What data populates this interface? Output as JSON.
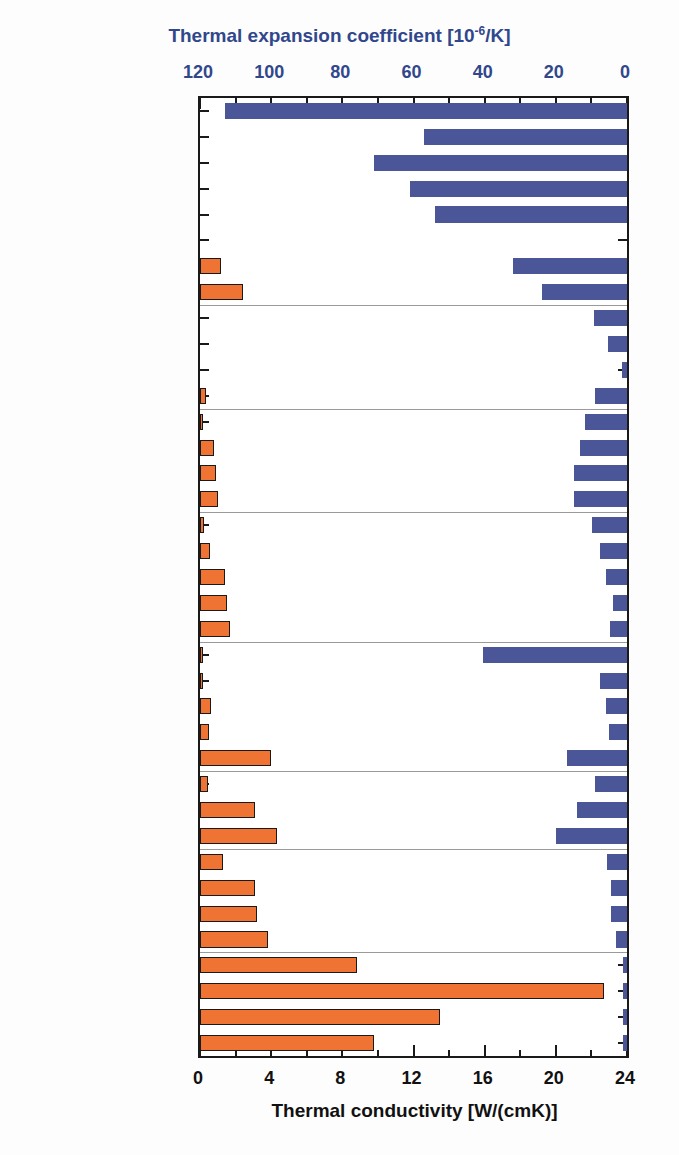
{
  "chart_data": {
    "type": "bar",
    "orientation": "horizontal",
    "title": "",
    "top_axis": {
      "label": "Thermal expansion coefficient [10-6/K]",
      "label_main": "Thermal expansion coefficient [10",
      "label_sup": "-6",
      "label_tail": "/K]",
      "ticks": [
        120,
        100,
        80,
        60,
        40,
        20,
        0
      ],
      "range": [
        120,
        0
      ],
      "reversed": true,
      "color": "#31478c"
    },
    "bottom_axis": {
      "label": "Thermal conductivity [W/(cmK)]",
      "ticks": [
        0,
        4,
        8,
        12,
        16,
        20,
        24
      ],
      "range": [
        0,
        24
      ],
      "color": "#111111"
    },
    "series": [
      {
        "name": "Thermal expansion coefficient",
        "color": "#4b5699",
        "axis": "top"
      },
      {
        "name": "Thermal conductivity",
        "color": "#ef7433",
        "axis": "bottom"
      }
    ],
    "categories": [
      "polyamide",
      "polyimide",
      "polycarbonate",
      "PET",
      "PVC",
      "polyvinyl alcohol",
      "Zn",
      "Al",
      "soda lime glass",
      "Schott AF 45",
      "Fused Silica",
      "Al2O3",
      "Y",
      "Fe",
      "Ni",
      "Co",
      "Ti",
      "Ta",
      "Mo",
      "Si",
      "W",
      "KBr",
      "ZnSe",
      "Ge",
      "ZnO",
      "Cu",
      "Pt",
      "Au",
      "Ag",
      "a-GaN",
      "3C-SiC",
      "w-AlN",
      "h-BN",
      "diamond type I",
      "diamond type IIa",
      "diamond type IIb",
      "CVD diamond"
    ],
    "expansion": [
      113,
      57,
      71,
      61,
      54,
      0,
      32,
      24,
      9.3,
      5.3,
      1.4,
      9.0,
      11.8,
      13.2,
      14.9,
      14.9,
      9.8,
      7.6,
      5.9,
      3.9,
      4.8,
      40.5,
      7.6,
      6.0,
      5.0,
      17.0,
      9.0,
      14.0,
      20.0,
      5.5,
      4.5,
      4.5,
      3.0,
      1.2,
      1.2,
      1.2,
      1.2
    ],
    "conductivity": [
      0,
      0,
      0,
      0,
      0,
      0,
      1.2,
      2.4,
      0,
      0,
      0,
      0.35,
      0.17,
      0.8,
      0.9,
      1.0,
      0.2,
      0.57,
      1.4,
      1.5,
      1.7,
      0.05,
      0.18,
      0.6,
      0.5,
      4.0,
      0.45,
      3.1,
      4.3,
      1.3,
      3.1,
      3.2,
      3.8,
      8.8,
      22.7,
      13.5,
      9.8
    ],
    "group_breaks_after": [
      7,
      11,
      15,
      20,
      25,
      28,
      32
    ],
    "grid": false,
    "legend": "none"
  },
  "labels_display": [
    {
      "text": "polyamide"
    },
    {
      "text": "polyimide"
    },
    {
      "text": "polycarbonate"
    },
    {
      "text": "PET"
    },
    {
      "text": "PVC"
    },
    {
      "text": "polyvinyl alcohol"
    },
    {
      "text": "Zn"
    },
    {
      "text": "Al"
    },
    {
      "text": "soda lime glass"
    },
    {
      "text": "Schott AF 45"
    },
    {
      "text": "Fused Silica"
    },
    {
      "text": "Al2O3",
      "html": true
    },
    {
      "text": "Y"
    },
    {
      "text": "Fe"
    },
    {
      "text": "Ni"
    },
    {
      "text": "Co"
    },
    {
      "text": "Ti"
    },
    {
      "text": "Ta"
    },
    {
      "text": "Mo"
    },
    {
      "text": "Si"
    },
    {
      "text": "W"
    },
    {
      "text": "KBr"
    },
    {
      "text": "ZnSe"
    },
    {
      "text": "Ge"
    },
    {
      "text": "ZnO"
    },
    {
      "text": "Cu"
    },
    {
      "text": "Pt"
    },
    {
      "text": "Au"
    },
    {
      "text": "Ag"
    },
    {
      "text": "a-GaN"
    },
    {
      "text": "3C-SiC"
    },
    {
      "text": "w-AlN"
    },
    {
      "text": "h-BN"
    },
    {
      "text": "diamond type I"
    },
    {
      "text": "diamond type IIa"
    },
    {
      "text": "diamond type IIb"
    },
    {
      "text": "CVD diamond"
    }
  ]
}
